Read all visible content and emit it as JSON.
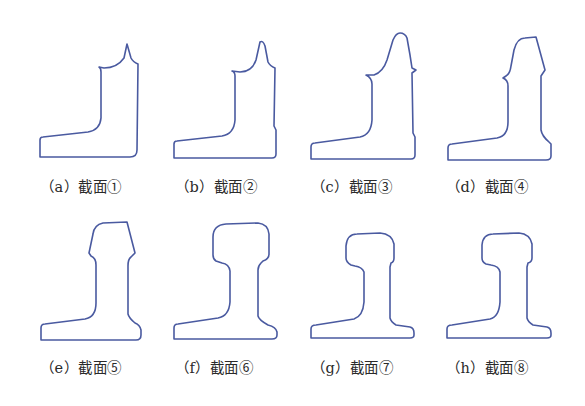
{
  "figure": {
    "stroke_color": "#4a5aa0",
    "background": "#ffffff",
    "panels": [
      {
        "id": "a",
        "label": "（a）截面①",
        "section": "截面①"
      },
      {
        "id": "b",
        "label": "（b）截面②",
        "section": "截面②"
      },
      {
        "id": "c",
        "label": "（c）截面③",
        "section": "截面③"
      },
      {
        "id": "d",
        "label": "（d）截面④",
        "section": "截面④"
      },
      {
        "id": "e",
        "label": "（e）截面⑤",
        "section": "截面⑤"
      },
      {
        "id": "f",
        "label": "（f）截面⑥",
        "section": "截面⑥"
      },
      {
        "id": "g",
        "label": "（g）截面⑦",
        "section": "截面⑦"
      },
      {
        "id": "h",
        "label": "（h）截面⑧",
        "section": "截面⑧"
      }
    ]
  }
}
